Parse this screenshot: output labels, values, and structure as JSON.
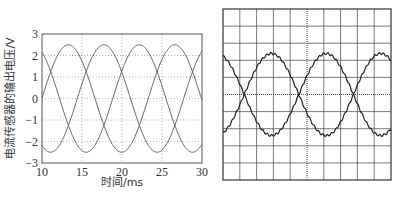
{
  "chart_data": [
    {
      "type": "line",
      "title": "",
      "xlabel": "时间/ms",
      "ylabel": "电流传感器的输出电压/V",
      "xlim": [
        10,
        30
      ],
      "ylim": [
        -3,
        3
      ],
      "xticks": [
        "10",
        "15",
        "20",
        "25",
        "30"
      ],
      "yticks": [
        "3",
        "2",
        "1",
        "0",
        "-1",
        "-2",
        "-3"
      ],
      "grid": true,
      "series": [
        {
          "name": "phase-a",
          "amplitude": 2.5,
          "period_ms": 13.3,
          "phase_deg": 0
        },
        {
          "name": "phase-b",
          "amplitude": 2.5,
          "period_ms": 13.3,
          "phase_deg": 120
        },
        {
          "name": "phase-c",
          "amplitude": 2.5,
          "period_ms": 13.3,
          "phase_deg": 240
        }
      ]
    },
    {
      "type": "line",
      "title": "",
      "grid": true,
      "grid_divisions": [
        10,
        10
      ],
      "series": [
        {
          "name": "trace-1",
          "amplitude_div": 2.4,
          "period_div": 6.5,
          "phase_deg": 0
        },
        {
          "name": "trace-2",
          "amplitude_div": 2.4,
          "period_div": 6.5,
          "phase_deg": 180
        }
      ]
    }
  ]
}
